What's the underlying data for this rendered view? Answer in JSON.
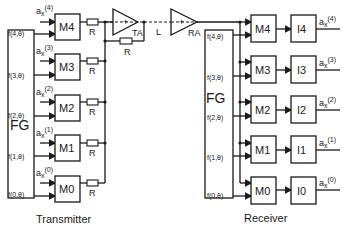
{
  "transmitter": {
    "label": "Transmitter",
    "generator": "FG",
    "modulators": [
      {
        "name": "M4",
        "freq": "f(4,θ)",
        "input": "a",
        "input_sub": "x",
        "input_sup": "(4)",
        "resistor": "R"
      },
      {
        "name": "M3",
        "freq": "f(3,θ)",
        "input": "a",
        "input_sub": "x",
        "input_sup": "(3)",
        "resistor": "R"
      },
      {
        "name": "M2",
        "freq": "f(2,θ)",
        "input": "a",
        "input_sub": "x",
        "input_sup": "(2)",
        "resistor": "R"
      },
      {
        "name": "M1",
        "freq": "f(1,θ)",
        "input": "a",
        "input_sub": "x",
        "input_sup": "(1)",
        "resistor": "R"
      },
      {
        "name": "M0",
        "freq": "f(0,θ)",
        "input": "a",
        "input_sub": "x",
        "input_sup": "(0)",
        "resistor": "R"
      }
    ],
    "amplifier": {
      "label": "TA",
      "sign": "+",
      "feedback_resistor": "R"
    }
  },
  "line": {
    "label": "L"
  },
  "receiver": {
    "label": "Receiver",
    "generator": "FG",
    "amplifier": {
      "label": "RA",
      "sign": "+"
    },
    "channels": [
      {
        "modulator": "M4",
        "integrator": "I4",
        "freq": "f(4,θ)",
        "output": "a",
        "output_sub": "x",
        "output_sup": "(4)"
      },
      {
        "modulator": "M3",
        "integrator": "I3",
        "freq": "f(3,θ)",
        "output": "a",
        "output_sub": "x",
        "output_sup": "(3)"
      },
      {
        "modulator": "M2",
        "integrator": "I2",
        "freq": "f(2,θ)",
        "output": "a",
        "output_sub": "x",
        "output_sup": "(2)"
      },
      {
        "modulator": "M1",
        "integrator": "I1",
        "freq": "f(1,θ)",
        "output": "a",
        "output_sub": "x",
        "output_sup": "(1)"
      },
      {
        "modulator": "M0",
        "integrator": "I0",
        "freq": "f(0,θ)",
        "output": "a",
        "output_sub": "x",
        "output_sup": "(0)"
      }
    ]
  }
}
